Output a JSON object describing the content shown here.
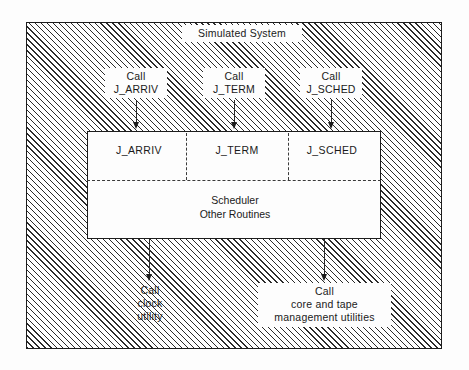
{
  "figure": {
    "title": "Simulated System",
    "main_box": {
      "routines": [
        {
          "name": "J_ARRIV"
        },
        {
          "name": "J_TERM"
        },
        {
          "name": "J_SCHED"
        }
      ],
      "lower_section_label": "Scheduler\nOther Routines"
    },
    "incoming_calls": [
      {
        "label": "Call\nJ_ARRIV",
        "target": "J_ARRIV"
      },
      {
        "label": "Call\nJ_TERM",
        "target": "J_TERM"
      },
      {
        "label": "Call\nJ_SCHED",
        "target": "J_SCHED"
      }
    ],
    "outgoing_calls": [
      {
        "label": "Call\nclock\nutility"
      },
      {
        "label": "Call\ncore and tape\nmanagement utilities"
      }
    ],
    "colors": {
      "ink": "#1a1a1a",
      "hatch": "#2b2b2b",
      "paper": "#fdfdfd",
      "dash": "#3a3a3a"
    }
  }
}
